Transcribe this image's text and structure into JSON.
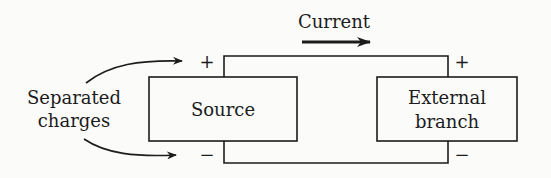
{
  "diagram": {
    "current_label": "Current",
    "separated_label_line1": "Separated",
    "separated_label_line2": "charges",
    "source_label": "Source",
    "external_label_line1": "External",
    "external_label_line2": "branch",
    "source_plus": "+",
    "source_minus": "−",
    "external_plus": "+",
    "external_minus": "−",
    "stroke_color": "#1c1c1c",
    "background": "#fbfbfa"
  }
}
